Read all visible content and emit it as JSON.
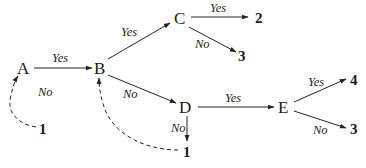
{
  "diagram": {
    "type": "decision-flow",
    "nodes": [
      {
        "id": "A",
        "label": "A"
      },
      {
        "id": "B",
        "label": "B"
      },
      {
        "id": "C",
        "label": "C"
      },
      {
        "id": "D",
        "label": "D"
      },
      {
        "id": "E",
        "label": "E"
      }
    ],
    "terminals": [
      {
        "id": "t1a",
        "label": "1"
      },
      {
        "id": "t2",
        "label": "2"
      },
      {
        "id": "t3c",
        "label": "3"
      },
      {
        "id": "t1d",
        "label": "1"
      },
      {
        "id": "t4",
        "label": "4"
      },
      {
        "id": "t3e",
        "label": "3"
      }
    ],
    "edges": [
      {
        "from": "A",
        "to": "B",
        "label": "Yes",
        "style": "solid"
      },
      {
        "from": "A",
        "to": "t1a",
        "label": "No",
        "style": "dashed-loop"
      },
      {
        "from": "B",
        "to": "C",
        "label": "Yes",
        "style": "solid"
      },
      {
        "from": "B",
        "to": "D",
        "label": "No",
        "style": "solid"
      },
      {
        "from": "C",
        "to": "t2",
        "label": "Yes",
        "style": "solid"
      },
      {
        "from": "C",
        "to": "t3c",
        "label": "No",
        "style": "solid"
      },
      {
        "from": "D",
        "to": "E",
        "label": "Yes",
        "style": "solid"
      },
      {
        "from": "D",
        "to": "t1d",
        "label": "No",
        "style": "solid"
      },
      {
        "from": "t1d",
        "to": "B",
        "label": "",
        "style": "dashed-loop"
      },
      {
        "from": "E",
        "to": "t4",
        "label": "Yes",
        "style": "solid"
      },
      {
        "from": "E",
        "to": "t3e",
        "label": "No",
        "style": "solid"
      }
    ],
    "edge_labels": {
      "ab_yes": "Yes",
      "a_no": "No",
      "bc_yes": "Yes",
      "bd_no": "No",
      "c2_yes": "Yes",
      "c3_no": "No",
      "de_yes": "Yes",
      "d1_no": "No",
      "e4_yes": "Yes",
      "e3_no": "No"
    }
  }
}
